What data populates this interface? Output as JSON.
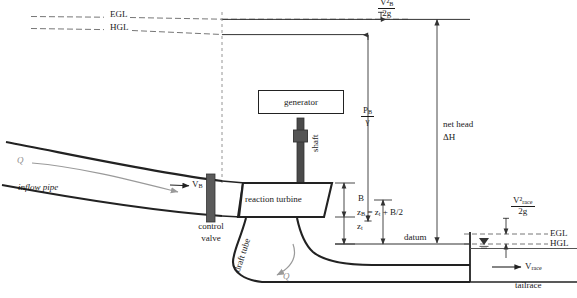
{
  "figure": {
    "type": "engineering-diagram",
    "colors": {
      "line": "#222222",
      "thin_line": "#555555",
      "dashed_grade_line": "#777777",
      "flow_arrow": "#9a9a9a",
      "valve_fill": "#5a5a5a",
      "shaft_fill": "#4a4a4a",
      "background": "#ffffff"
    }
  },
  "grade_lines": {
    "upstream_egl_label": "EGL",
    "upstream_hgl_label": "HGL",
    "tailrace_egl_label": "EGL",
    "tailrace_hgl_label": "HGL"
  },
  "labels": {
    "velocity_head_B_num": "V²",
    "velocity_head_B_num_sub": "B",
    "velocity_head_B_den": "2g",
    "pressure_head_B_num": "P",
    "pressure_head_B_num_sub": "B",
    "pressure_head_B_den": "γ",
    "net_head_line1": "net head",
    "net_head_line2": "ΔH",
    "generator": "generator",
    "shaft": "shaft",
    "reaction_turbine": "reaction turbine",
    "control_valve_line1": "control",
    "control_valve_line2": "valve",
    "draft_tube": "draft tube",
    "inflow_pipe": "inflow pipe",
    "discharge_inflow": "Q",
    "discharge_outflow": "Q",
    "velocity_B": "V",
    "velocity_B_sub": "B",
    "turbine_height": "B",
    "elevation_t": "z",
    "elevation_t_sub": "t",
    "elevation_equation": "zʙ = zₜ + B/2",
    "elevation_eq_main": "z",
    "elevation_eq_main_sub": "B",
    "elevation_eq_rest": " = z",
    "elevation_eq_rest_sub": "t",
    "elevation_eq_tail": " + B/2",
    "datum": "datum",
    "velocity_head_race_num": "V²",
    "velocity_head_race_num_sub": "race",
    "velocity_head_race_den": "2g",
    "velocity_race": "V",
    "velocity_race_sub": "race",
    "tailrace": "tailrace"
  }
}
